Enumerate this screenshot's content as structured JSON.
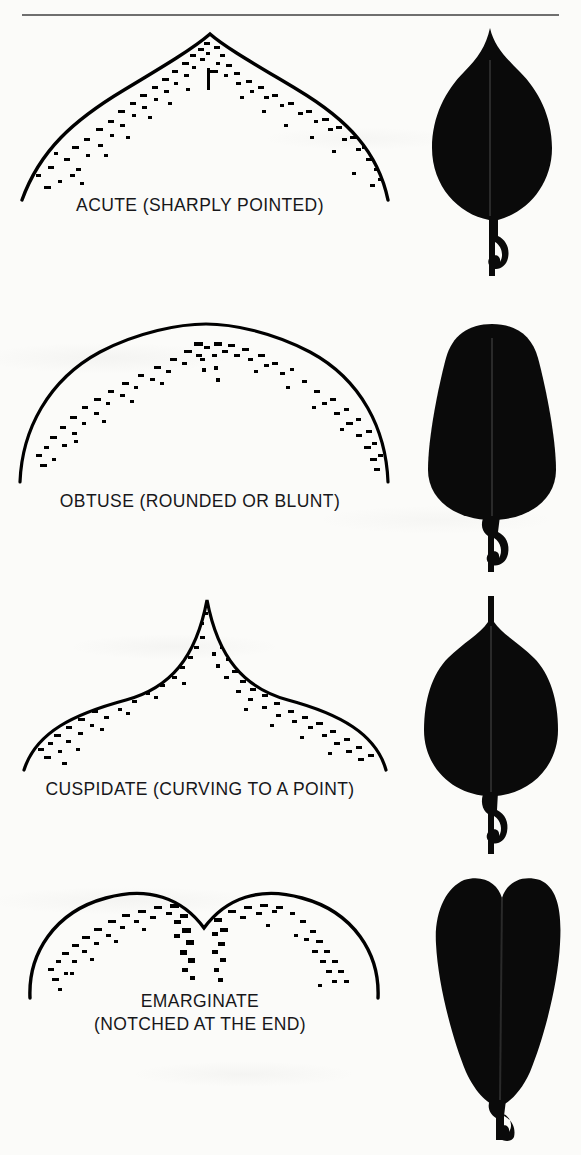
{
  "page": {
    "background_color": "#fbfbf9",
    "ink_color": "#000000",
    "rule_color": "#6f6f6f",
    "has_top_rule": true
  },
  "figures": [
    {
      "id": "acute",
      "caption": "ACUTE (SHARPLY POINTED)",
      "caption_lines": [
        "ACUTE (SHARPLY POINTED)"
      ],
      "apex_drawing": "acute-apex-outline-stippled",
      "apex_description": "Sharply pointed peak with straight converging sides, stipple shading inside outline",
      "leaf_silhouette": "ovate-leaf-acute-tip",
      "leaf_description": "Solid black ovate leaf with pointed tip, widest below middle, hooked petiole"
    },
    {
      "id": "obtuse",
      "caption": "OBTUSE (ROUNDED OR BLUNT)",
      "caption_lines": [
        "OBTUSE (ROUNDED OR BLUNT)"
      ],
      "apex_drawing": "obtuse-apex-outline-stippled",
      "apex_description": "Broad rounded dome apex with stipple shading inside outline",
      "leaf_silhouette": "obovate-leaf-obtuse-tip",
      "leaf_description": "Solid black obovate leaf with broadly rounded blunt tip and hooked petiole"
    },
    {
      "id": "cuspidate",
      "caption": "CUSPIDATE (CURVING TO A POINT)",
      "caption_lines": [
        "CUSPIDATE (CURVING TO A POINT)"
      ],
      "apex_drawing": "cuspidate-apex-outline-stippled",
      "apex_description": "Concave sides curving upward into an abrupt sharp spike, stipple shading inside outline",
      "leaf_silhouette": "elliptic-leaf-cuspidate-tip",
      "leaf_description": "Solid black elliptic leaf ending in a narrow drawn-out cusp, hooked petiole"
    },
    {
      "id": "emarginate",
      "caption": "EMARGINATE (NOTCHED AT THE END)",
      "caption_lines": [
        "EMARGINATE",
        "(NOTCHED AT THE END)"
      ],
      "apex_drawing": "emarginate-apex-outline-stippled",
      "apex_description": "Two rounded lobes separated by a central V notch, stipple shading inside outline",
      "leaf_silhouette": "obovate-leaf-emarginate-tip",
      "leaf_description": "Solid black obovate leaf with a notched indented tip and hooked petiole"
    }
  ]
}
